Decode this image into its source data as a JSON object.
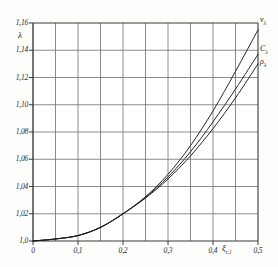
{
  "figure": {
    "background_color": "#fdfdfc",
    "frame_color": "#3a3a3a",
    "grid_color": "#6e6e6e",
    "curve_color": "#1c1c1c"
  },
  "axes": {
    "y_symbol": "λ",
    "x_symbol_main": "ξ",
    "x_symbol_sub": "c,l",
    "y_tick_labels": [
      "1,16",
      "1,14",
      "1,12",
      "1,10",
      "1,08",
      "1,06",
      "1,04",
      "1,02",
      "1,0"
    ],
    "x_tick_labels": [
      "0",
      "0,1",
      "0,2",
      "0,3",
      "0,4",
      "0,5"
    ]
  },
  "curve_labels": [
    {
      "name": "nu-lambda",
      "main": "ν",
      "sub": "λ"
    },
    {
      "name": "c-lambda",
      "main": "C",
      "sub": "λ"
    },
    {
      "name": "rho-lambda",
      "main": "ρ",
      "sub": "λ"
    }
  ],
  "chart_data": {
    "type": "line",
    "title": "",
    "xlabel": "ξ c,l",
    "ylabel": "λ",
    "xlim": [
      0,
      0.5
    ],
    "ylim": [
      1.0,
      1.16
    ],
    "x_major_ticks": [
      0,
      0.1,
      0.2,
      0.3,
      0.4,
      0.5
    ],
    "x_minor_ticks": [
      0.05,
      0.15,
      0.25,
      0.35,
      0.45
    ],
    "y_ticks": [
      1.0,
      1.02,
      1.04,
      1.06,
      1.08,
      1.1,
      1.12,
      1.14,
      1.16
    ],
    "grid": true,
    "legend": "inline-curve-labels-right",
    "x": [
      0,
      0.05,
      0.1,
      0.15,
      0.2,
      0.25,
      0.3,
      0.35,
      0.4,
      0.45,
      0.5
    ],
    "series": [
      {
        "name": "νλ",
        "label": "nu-lambda",
        "values": [
          1.0,
          1.0015,
          1.004,
          1.01,
          1.02,
          1.0325,
          1.049,
          1.07,
          1.0955,
          1.1245,
          1.155
        ]
      },
      {
        "name": "Cλ",
        "label": "c-lambda",
        "values": [
          1.0,
          1.0015,
          1.004,
          1.01,
          1.02,
          1.032,
          1.047,
          1.0655,
          1.0875,
          1.1115,
          1.137
        ]
      },
      {
        "name": "ρλ",
        "label": "rho-lambda",
        "values": [
          1.0,
          1.0015,
          1.004,
          1.01,
          1.02,
          1.0315,
          1.0455,
          1.0625,
          1.0825,
          1.105,
          1.13
        ]
      }
    ]
  }
}
